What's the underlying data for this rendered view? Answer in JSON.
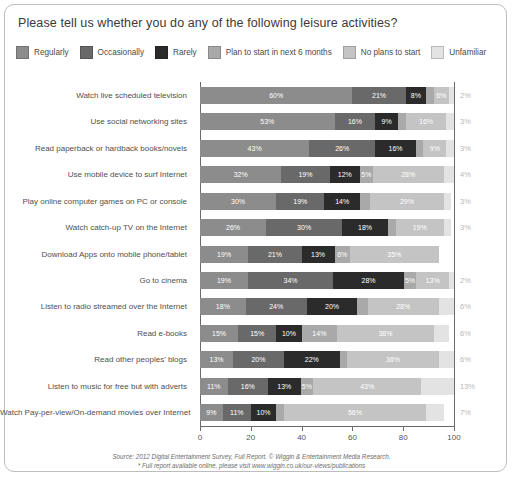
{
  "header": {
    "title": "Please tell us whether you do any of the following leisure activities?"
  },
  "legend": {
    "items": [
      {
        "label": "Regularly",
        "color": "#8c8c8c",
        "name": "legend-regularly"
      },
      {
        "label": "Occasionally",
        "color": "#696969",
        "name": "legend-occasionally"
      },
      {
        "label": "Rarely",
        "color": "#2b2b2b",
        "name": "legend-rarely"
      },
      {
        "label": "Plan to start in next 6 months",
        "color": "#a9a9a9",
        "name": "legend-plan-to-start"
      },
      {
        "label": "No plans to start",
        "color": "#c4c4c4",
        "name": "legend-no-plans"
      },
      {
        "label": "Unfamiliar",
        "color": "#e3e3e3",
        "name": "legend-unfamiliar"
      }
    ]
  },
  "footer": {
    "line1": "Source: 2012 Digital Entertainment Survey, Full Report. © Wiggin & Entertainment Media Research.",
    "line2": "* Full report available online, please visit www.wiggin.co.uk/our-views/publications"
  },
  "chart_data": {
    "type": "bar",
    "orientation": "horizontal",
    "stacked": true,
    "percent": true,
    "title": "Please tell us whether you do any of the following leisure activities?",
    "xlabel": "",
    "ylabel": "",
    "xlim": [
      0,
      100
    ],
    "xticks": [
      0,
      20,
      40,
      60,
      80,
      100
    ],
    "grid": false,
    "legend_position": "top",
    "series": [
      {
        "name": "Regularly",
        "color": "#8c8c8c",
        "values": [
          60,
          53,
          43,
          32,
          30,
          26,
          19,
          19,
          18,
          15,
          13,
          11,
          9
        ]
      },
      {
        "name": "Occasionally",
        "color": "#696969",
        "values": [
          21,
          16,
          26,
          19,
          19,
          30,
          21,
          34,
          24,
          15,
          20,
          16,
          11
        ]
      },
      {
        "name": "Rarely",
        "color": "#2b2b2b",
        "values": [
          8,
          9,
          16,
          12,
          14,
          18,
          13,
          28,
          20,
          10,
          22,
          13,
          10
        ]
      },
      {
        "name": "Plan to start in next 6 months",
        "color": "#a9a9a9",
        "values": [
          3,
          3,
          3,
          5,
          4,
          3,
          6,
          5,
          4,
          14,
          3,
          5,
          3
        ]
      },
      {
        "name": "No plans to start",
        "color": "#c4c4c4",
        "values": [
          6,
          16,
          9,
          28,
          29,
          19,
          35,
          13,
          28,
          38,
          36,
          43,
          56
        ]
      },
      {
        "name": "Unfamiliar",
        "color": "#e3e3e3",
        "values": [
          2,
          3,
          3,
          4,
          3,
          3,
          0,
          2,
          6,
          6,
          6,
          13,
          7
        ]
      }
    ],
    "categories": [
      "Watch live scheduled television",
      "Use social networking sites",
      "Read paperback or hardback books/novels",
      "Use mobile device to surf Internet",
      "Play online computer games on PC or console",
      "Watch catch-up TV on the Internet",
      "Download Apps onto mobile phone/tablet",
      "Go to cinema",
      "Listen to radio streamed over the Internet",
      "Read e-books",
      "Read other peoples' blogs",
      "Listen to music for free but with adverts",
      "Watch Pay-per-view/On-demand movies over Internet"
    ],
    "unfamiliar_labels": [
      "2%",
      "3%",
      "3%",
      "4%",
      "3%",
      "3%",
      "",
      "2%",
      "6%",
      "6%",
      "6%",
      "13%",
      "7%"
    ],
    "bar_labels": [
      [
        "60%",
        "21%",
        "8%",
        "3%",
        "6%",
        ""
      ],
      [
        "53%",
        "16%",
        "9%",
        "3%",
        "16%",
        ""
      ],
      [
        "43%",
        "26%",
        "16%",
        "3%",
        "9%",
        ""
      ],
      [
        "32%",
        "19%",
        "12%",
        "5%",
        "28%",
        ""
      ],
      [
        "30%",
        "19%",
        "14%",
        "4%",
        "29%",
        ""
      ],
      [
        "26%",
        "30%",
        "18%",
        "3%",
        "19%",
        ""
      ],
      [
        "19%",
        "21%",
        "13%",
        "6%",
        "35%",
        ""
      ],
      [
        "19%",
        "34%",
        "28%",
        "5%",
        "13%",
        ""
      ],
      [
        "18%",
        "24%",
        "20%",
        "4%",
        "28%",
        ""
      ],
      [
        "15%",
        "15%",
        "10%",
        "14%",
        "38%",
        ""
      ],
      [
        "13%",
        "20%",
        "22%",
        "3%",
        "36%",
        ""
      ],
      [
        "11%",
        "16%",
        "13%",
        "5%",
        "43%",
        ""
      ],
      [
        "9%",
        "11%",
        "10%",
        "3%",
        "56%",
        ""
      ]
    ]
  }
}
